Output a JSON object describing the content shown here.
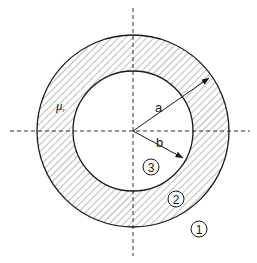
{
  "figure": {
    "colors": {
      "stroke": "#1a1a1a",
      "hatch": "#6a6a6a",
      "background": "#ffffff"
    },
    "geometry": {
      "center": [
        133,
        131
      ],
      "outer_radius": 96,
      "inner_radius": 60
    },
    "labels": {
      "permeability": "μ",
      "permeability_sub": "r",
      "radius_a": "a",
      "radius_b": "b",
      "region_1": "1",
      "region_2": "2",
      "region_3": "3"
    },
    "regions": [
      {
        "id": "1",
        "description": "outer region (outside shield)"
      },
      {
        "id": "2",
        "description": "shield wall (hatched, permeability μr)"
      },
      {
        "id": "3",
        "description": "inner cavity"
      }
    ]
  }
}
